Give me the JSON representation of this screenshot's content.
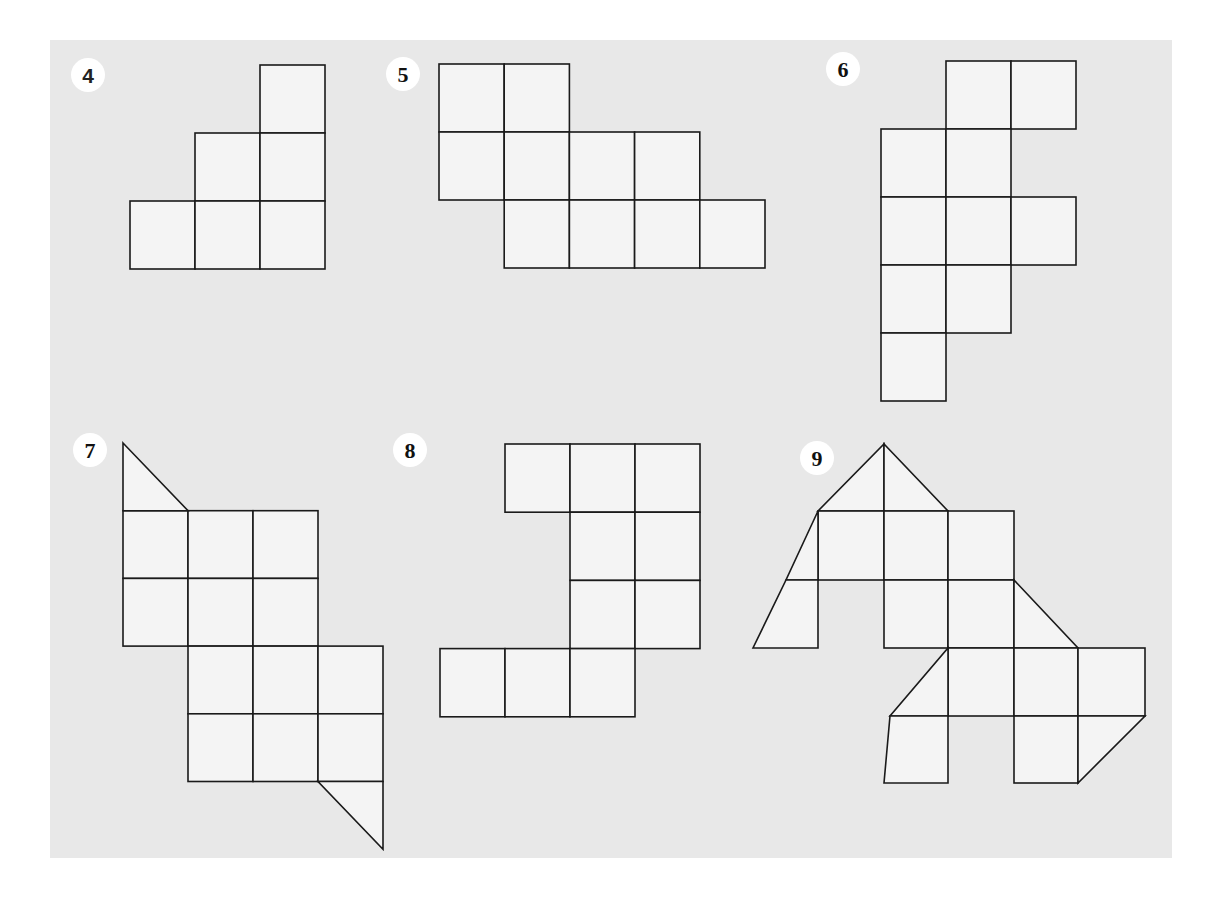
{
  "figures": [
    {
      "label": "4",
      "cells": [
        [
          2,
          0
        ],
        [
          1,
          1
        ],
        [
          2,
          1
        ],
        [
          0,
          2
        ],
        [
          1,
          2
        ],
        [
          2,
          2
        ]
      ],
      "triangles": []
    },
    {
      "label": "5",
      "cells": [
        [
          0,
          0
        ],
        [
          1,
          0
        ],
        [
          0,
          1
        ],
        [
          1,
          1
        ],
        [
          2,
          1
        ],
        [
          3,
          1
        ],
        [
          1,
          2
        ],
        [
          2,
          2
        ],
        [
          3,
          2
        ],
        [
          4,
          2
        ]
      ],
      "triangles": []
    },
    {
      "label": "6",
      "cells": [
        [
          1,
          0
        ],
        [
          2,
          0
        ],
        [
          0,
          1
        ],
        [
          1,
          1
        ],
        [
          0,
          2
        ],
        [
          1,
          2
        ],
        [
          2,
          2
        ],
        [
          0,
          3
        ],
        [
          1,
          3
        ],
        [
          0,
          4
        ]
      ],
      "triangles": []
    },
    {
      "label": "7",
      "cells": [
        [
          0,
          1
        ],
        [
          1,
          1
        ],
        [
          2,
          1
        ],
        [
          0,
          2
        ],
        [
          1,
          2
        ],
        [
          2,
          2
        ],
        [
          1,
          3
        ],
        [
          2,
          3
        ],
        [
          3,
          3
        ],
        [
          1,
          4
        ],
        [
          2,
          4
        ],
        [
          3,
          4
        ]
      ],
      "triangles": [
        [
          [
            0,
            0
          ],
          [
            1,
            1
          ],
          [
            0,
            1
          ]
        ],
        [
          [
            3,
            5
          ],
          [
            4,
            5
          ],
          [
            4,
            6
          ]
        ]
      ]
    },
    {
      "label": "8",
      "cells": [
        [
          1,
          0
        ],
        [
          2,
          0
        ],
        [
          3,
          0
        ],
        [
          2,
          1
        ],
        [
          3,
          1
        ],
        [
          2,
          2
        ],
        [
          3,
          2
        ],
        [
          0,
          3
        ],
        [
          1,
          3
        ],
        [
          2,
          3
        ]
      ],
      "triangles": []
    },
    {
      "label": "9",
      "cells": [
        [
          1,
          1
        ],
        [
          2,
          1
        ],
        [
          3,
          1
        ],
        [
          1,
          2
        ],
        [
          2,
          2
        ],
        [
          3,
          2
        ],
        [
          1,
          2.0
        ],
        [
          3,
          3
        ],
        [
          4,
          3
        ],
        [
          5,
          3
        ],
        [
          3,
          4
        ],
        [
          4,
          4
        ],
        [
          5,
          4
        ]
      ],
      "triangles": [
        [
          [
            1,
            1
          ],
          [
            2,
            0
          ],
          [
            3,
            1
          ]
        ],
        [
          [
            1,
            1
          ],
          [
            0,
            3
          ],
          [
            1,
            3
          ]
        ],
        [
          [
            4,
            2
          ],
          [
            5,
            3
          ],
          [
            4,
            3
          ]
        ],
        [
          [
            3,
            3
          ],
          [
            2,
            5
          ],
          [
            3,
            5
          ]
        ],
        [
          [
            6,
            4
          ],
          [
            5,
            5
          ],
          [
            6,
            3
          ]
        ]
      ]
    }
  ]
}
